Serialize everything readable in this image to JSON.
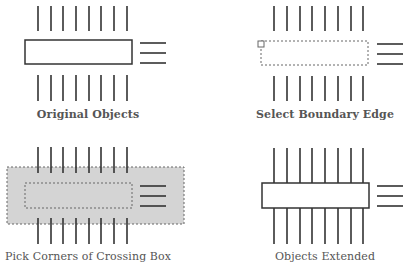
{
  "colors": {
    "line": "#333333",
    "rect_stroke": "#333333",
    "dashed": "#666666",
    "crossing_fill": "#d4d4d4",
    "label": "#555555"
  },
  "panels": [
    {
      "id": "original",
      "label": "Original Objects",
      "label_pos": [
        88,
        108
      ],
      "vlines_x": [
        38,
        51,
        63,
        76,
        89,
        101,
        114,
        127
      ],
      "top_lines": [
        6,
        31
      ],
      "bottom_lines": [
        75,
        101
      ],
      "rect": {
        "x": 25,
        "y": 40,
        "w": 107,
        "h": 24,
        "style": "solid"
      },
      "hlines": {
        "x1": 140,
        "x2": 166,
        "y": [
          43,
          53,
          63
        ]
      }
    },
    {
      "id": "select-boundary",
      "label": "Select Boundary Edge",
      "label_pos": [
        325,
        108
      ],
      "vlines_x": [
        274,
        287,
        300,
        312,
        325,
        338,
        351,
        363
      ],
      "top_lines": [
        6,
        31
      ],
      "bottom_lines": [
        76,
        101
      ],
      "rect": {
        "x": 261,
        "y": 41,
        "w": 107,
        "h": 24,
        "style": "dashed"
      },
      "pickbox": {
        "x": 258,
        "y": 41,
        "size": 6
      },
      "hlines": {
        "x1": 377,
        "x2": 403,
        "y": [
          44,
          54,
          64
        ]
      }
    },
    {
      "id": "crossing-box",
      "label": "Pick Corners of Crossing Box",
      "label_pos": [
        88,
        250
      ],
      "vlines_x": [
        38,
        51,
        63,
        76,
        89,
        101,
        114,
        127
      ],
      "top_lines": [
        147,
        173
      ],
      "bottom_lines": [
        218,
        244
      ],
      "crossing": {
        "x": 7,
        "y": 167,
        "w": 177,
        "h": 57
      },
      "rect": {
        "x": 25,
        "y": 183,
        "w": 107,
        "h": 25,
        "style": "dashed"
      },
      "hlines": {
        "x1": 140,
        "x2": 166,
        "y": [
          186,
          196,
          206
        ]
      }
    },
    {
      "id": "extended",
      "label": "Objects Extended",
      "label_pos": [
        325,
        250
      ],
      "vlines_x": [
        274,
        287,
        300,
        312,
        325,
        338,
        351,
        363
      ],
      "full_lines": [
        148,
        244
      ],
      "rect": {
        "x": 262,
        "y": 183,
        "w": 107,
        "h": 25,
        "style": "solid"
      },
      "hlines": {
        "x1": 377,
        "x2": 403,
        "y": [
          186,
          196,
          206
        ]
      }
    }
  ]
}
